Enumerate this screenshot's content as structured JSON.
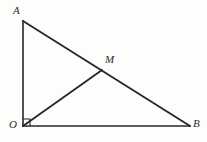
{
  "figure": {
    "kind": "geometry-diagram",
    "background_color": "#fdfdfb",
    "stroke_color": "#262626",
    "label_color": "#2b2b2b",
    "width": 207,
    "height": 142,
    "points": {
      "A": {
        "label": "A",
        "x": 23,
        "y": 21,
        "label_x": 13,
        "label_y": 5
      },
      "M": {
        "label": "M",
        "x": 102,
        "y": 70,
        "label_x": 105,
        "label_y": 54
      },
      "O": {
        "label": "O",
        "x": 23,
        "y": 126,
        "label_x": 9,
        "label_y": 119
      },
      "B": {
        "label": "B",
        "x": 190,
        "y": 126,
        "label_x": 193,
        "label_y": 118
      }
    },
    "segments": [
      {
        "name": "OA",
        "from": "O",
        "to": "A",
        "width": 1.6
      },
      {
        "name": "OB",
        "from": "O",
        "to": "B",
        "width": 1.6
      },
      {
        "name": "AB",
        "from": "A",
        "to": "B",
        "width": 1.8
      },
      {
        "name": "OM",
        "from": "O",
        "to": "M",
        "width": 1.8
      }
    ],
    "right_angle": {
      "name": "right-angle-at-O",
      "vertex": "O",
      "size": 7,
      "width": 1.1
    }
  }
}
